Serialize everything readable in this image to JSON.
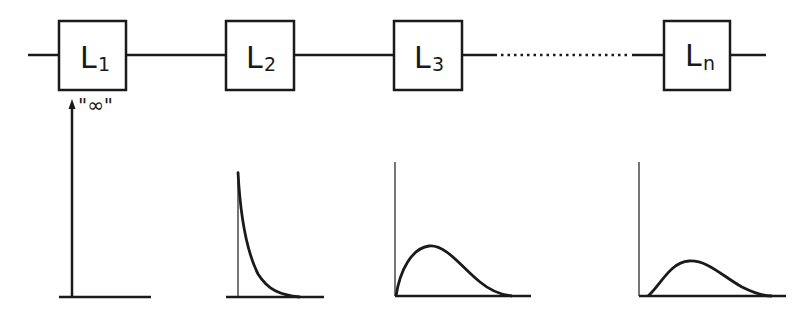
{
  "diagram": {
    "blocks": [
      {
        "id": "L1",
        "letter": "L",
        "subscript": "1"
      },
      {
        "id": "L2",
        "letter": "L",
        "subscript": "2"
      },
      {
        "id": "L3",
        "letter": "L",
        "subscript": "3"
      },
      {
        "id": "Ln",
        "letter": "L",
        "subscript": "n"
      }
    ],
    "infinity_label": "\"∞\"",
    "plots": [
      {
        "under": "L1",
        "shape": "impulse (delta spike)"
      },
      {
        "under": "L2",
        "shape": "exponential decay"
      },
      {
        "under": "L3",
        "shape": "skewed hump"
      },
      {
        "under": "Ln",
        "shape": "flatter, wider hump"
      }
    ],
    "colors": {
      "line": "#1a1a1a",
      "background": "#ffffff"
    }
  }
}
